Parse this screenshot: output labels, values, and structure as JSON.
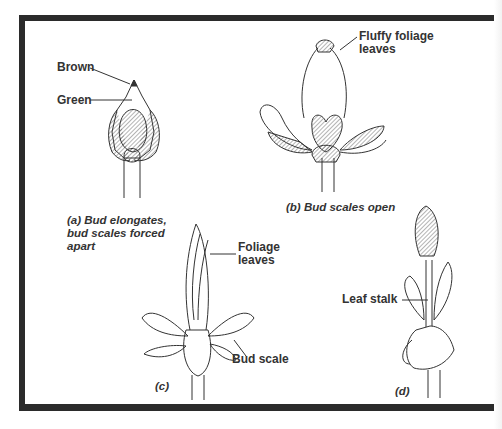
{
  "figure": {
    "panels": [
      {
        "id": "a",
        "caption_line1": "(a) Bud elongates,",
        "caption_line2": "bud scales forced",
        "caption_line3": "apart",
        "labels": [
          "Brown",
          "Green"
        ]
      },
      {
        "id": "b",
        "caption": "(b) Bud scales open",
        "labels": [
          "Fluffy foliage",
          "leaves"
        ]
      },
      {
        "id": "c",
        "caption": "(c)",
        "labels": [
          "Foliage",
          "leaves",
          "Bud scale"
        ]
      },
      {
        "id": "d",
        "caption": "(d)",
        "labels": [
          "Leaf stalk"
        ]
      }
    ]
  },
  "colors": {
    "frame": "#2b2b2b",
    "ink": "#333333",
    "background": "#ffffff"
  }
}
